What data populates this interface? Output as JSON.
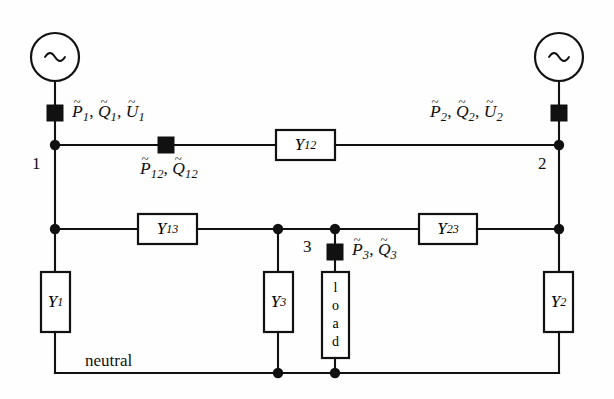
{
  "diagram": {
    "background_color": "#fefefe",
    "line_color": "#111111",
    "neutral_label": "neutral",
    "sources": [
      {
        "name": "source-1",
        "glyph": "~",
        "bus": "1"
      },
      {
        "name": "source-2",
        "glyph": "~",
        "bus": "2"
      }
    ],
    "bus_labels": {
      "bus1": "1",
      "bus2": "2",
      "bus3": "3"
    },
    "measurements": {
      "m1": {
        "p": "P",
        "p_sub": "1",
        "q": "Q",
        "q_sub": "1",
        "u": "U",
        "u_sub": "1",
        "sep": ", "
      },
      "m2": {
        "p": "P",
        "p_sub": "2",
        "q": "Q",
        "q_sub": "2",
        "u": "U",
        "u_sub": "2",
        "sep": ", "
      },
      "m12": {
        "p": "P",
        "p_sub": "12",
        "q": "Q",
        "q_sub": "12",
        "sep": ", "
      },
      "m3": {
        "p": "P",
        "p_sub": "3",
        "q": "Q",
        "q_sub": "3",
        "sep": ", "
      }
    },
    "admittances": [
      {
        "name": "Y12",
        "symbol": "Y",
        "sub": "12"
      },
      {
        "name": "Y13",
        "symbol": "Y",
        "sub": "13"
      },
      {
        "name": "Y23",
        "symbol": "Y",
        "sub": "23"
      },
      {
        "name": "Y1",
        "symbol": "Y",
        "sub": "1"
      },
      {
        "name": "Y2",
        "symbol": "Y",
        "sub": "2"
      },
      {
        "name": "Y3",
        "symbol": "Y",
        "sub": "3"
      }
    ],
    "load": {
      "label": "load",
      "letters": [
        "l",
        "o",
        "a",
        "d"
      ]
    },
    "tilde": "~"
  }
}
